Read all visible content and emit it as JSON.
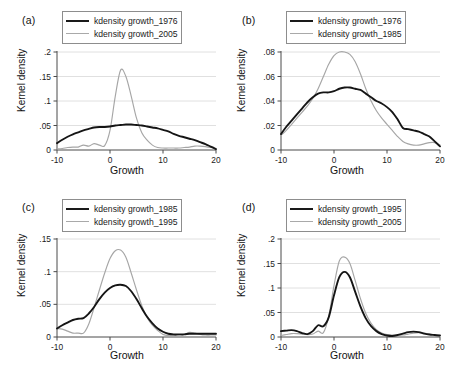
{
  "figure": {
    "xlabel": "Growth",
    "ylabel": "Kernel density",
    "xticks": [
      "-10",
      "0",
      "10",
      "20"
    ]
  },
  "panels": [
    {
      "label": "(a)",
      "legend": [
        {
          "name": "kdensity growth_1976",
          "style": "dark"
        },
        {
          "name": "kdensity growth_2005",
          "style": "light"
        }
      ],
      "yticks": [
        "0",
        ".05",
        ".1",
        ".15",
        ".2"
      ]
    },
    {
      "label": "(b)",
      "legend": [
        {
          "name": "kdensity growth_1976",
          "style": "dark"
        },
        {
          "name": "kdensity growth_1985",
          "style": "light"
        }
      ],
      "yticks": [
        "0",
        ".02",
        ".04",
        ".06",
        ".08"
      ]
    },
    {
      "label": "(c)",
      "legend": [
        {
          "name": "kdensity growth_1985",
          "style": "dark"
        },
        {
          "name": "kdensity growth_1995",
          "style": "light"
        }
      ],
      "yticks": [
        "0",
        ".05",
        ".1",
        ".15"
      ]
    },
    {
      "label": "(d)",
      "legend": [
        {
          "name": "kdensity growth_1995",
          "style": "dark"
        },
        {
          "name": "kdensity growth_2005",
          "style": "light"
        }
      ],
      "yticks": [
        "0",
        ".05",
        ".1",
        ".15",
        ".2"
      ]
    }
  ],
  "chart_data": [
    {
      "type": "line",
      "panel": "(a)",
      "title": "",
      "xlabel": "Growth",
      "ylabel": "Kernel density",
      "xlim": [
        -10,
        20
      ],
      "ylim": [
        0,
        0.2
      ],
      "grid": true,
      "legend_position": "top-center",
      "x": [
        -10,
        -9,
        -8,
        -7,
        -6,
        -5,
        -4,
        -3,
        -2,
        -1,
        0,
        1,
        2,
        3,
        4,
        5,
        6,
        7,
        8,
        9,
        10,
        11,
        12,
        13,
        14,
        15,
        16,
        17,
        18,
        19,
        20
      ],
      "series": [
        {
          "name": "kdensity growth_1976",
          "color": "#151515",
          "values": [
            0.014,
            0.021,
            0.027,
            0.032,
            0.036,
            0.04,
            0.043,
            0.046,
            0.047,
            0.047,
            0.048,
            0.05,
            0.051,
            0.052,
            0.052,
            0.051,
            0.05,
            0.048,
            0.046,
            0.044,
            0.041,
            0.038,
            0.033,
            0.029,
            0.026,
            0.023,
            0.02,
            0.016,
            0.012,
            0.007,
            0.002
          ]
        },
        {
          "name": "kdensity growth_2005",
          "color": "#a6a6a6",
          "values": [
            0.002,
            0.003,
            0.005,
            0.006,
            0.006,
            0.01,
            0.008,
            0.013,
            0.01,
            0.009,
            0.04,
            0.11,
            0.163,
            0.15,
            0.11,
            0.065,
            0.035,
            0.02,
            0.01,
            0.005,
            0.004,
            0.004,
            0.004,
            0.004,
            0.005,
            0.006,
            0.008,
            0.008,
            0.007,
            0.005,
            0.002
          ]
        }
      ]
    },
    {
      "type": "line",
      "panel": "(b)",
      "title": "",
      "xlabel": "Growth",
      "ylabel": "Kernel density",
      "xlim": [
        -10,
        20
      ],
      "ylim": [
        0,
        0.08
      ],
      "grid": true,
      "legend_position": "top-center",
      "x": [
        -10,
        -9,
        -8,
        -7,
        -6,
        -5,
        -4,
        -3,
        -2,
        -1,
        0,
        1,
        2,
        3,
        4,
        5,
        6,
        7,
        8,
        9,
        10,
        11,
        12,
        13,
        14,
        15,
        16,
        17,
        18,
        19,
        20
      ],
      "series": [
        {
          "name": "kdensity growth_1976",
          "color": "#151515",
          "values": [
            0.013,
            0.019,
            0.024,
            0.029,
            0.034,
            0.039,
            0.043,
            0.046,
            0.047,
            0.047,
            0.048,
            0.05,
            0.051,
            0.051,
            0.05,
            0.049,
            0.046,
            0.043,
            0.04,
            0.038,
            0.035,
            0.031,
            0.025,
            0.018,
            0.017,
            0.016,
            0.015,
            0.013,
            0.011,
            0.007,
            0.003
          ]
        },
        {
          "name": "kdensity growth_1985",
          "color": "#a6a6a6",
          "values": [
            0.012,
            0.016,
            0.021,
            0.026,
            0.031,
            0.036,
            0.042,
            0.05,
            0.06,
            0.07,
            0.077,
            0.08,
            0.08,
            0.078,
            0.072,
            0.062,
            0.05,
            0.04,
            0.032,
            0.026,
            0.021,
            0.016,
            0.011,
            0.007,
            0.005,
            0.004,
            0.004,
            0.005,
            0.006,
            0.006,
            0.004
          ]
        }
      ]
    },
    {
      "type": "line",
      "panel": "(c)",
      "title": "",
      "xlabel": "Growth",
      "ylabel": "Kernel density",
      "xlim": [
        -10,
        20
      ],
      "ylim": [
        0,
        0.15
      ],
      "grid": true,
      "legend_position": "top-center",
      "x": [
        -10,
        -9,
        -8,
        -7,
        -6,
        -5,
        -4,
        -3,
        -2,
        -1,
        0,
        1,
        2,
        3,
        4,
        5,
        6,
        7,
        8,
        9,
        10,
        11,
        12,
        13,
        14,
        15,
        16,
        17,
        18,
        19,
        20
      ],
      "series": [
        {
          "name": "kdensity growth_1985",
          "color": "#151515",
          "values": [
            0.013,
            0.018,
            0.022,
            0.026,
            0.028,
            0.029,
            0.036,
            0.046,
            0.058,
            0.068,
            0.075,
            0.079,
            0.08,
            0.078,
            0.07,
            0.058,
            0.044,
            0.031,
            0.021,
            0.013,
            0.008,
            0.005,
            0.004,
            0.004,
            0.004,
            0.005,
            0.005,
            0.005,
            0.005,
            0.005,
            0.005
          ]
        },
        {
          "name": "kdensity growth_1995",
          "color": "#a6a6a6",
          "values": [
            0.013,
            0.012,
            0.009,
            0.006,
            0.006,
            0.006,
            0.02,
            0.045,
            0.072,
            0.098,
            0.12,
            0.132,
            0.133,
            0.122,
            0.098,
            0.072,
            0.048,
            0.03,
            0.018,
            0.01,
            0.004,
            0.002,
            0.002,
            0.003,
            0.004,
            0.007,
            0.006,
            0.004,
            0.003,
            0.003,
            0.003
          ]
        }
      ]
    },
    {
      "type": "line",
      "panel": "(d)",
      "title": "",
      "xlabel": "Growth",
      "ylabel": "Kernel density",
      "xlim": [
        -10,
        20
      ],
      "ylim": [
        0,
        0.2
      ],
      "grid": true,
      "legend_position": "top-center",
      "x": [
        -10,
        -9,
        -8,
        -7,
        -6,
        -5,
        -4,
        -3,
        -2,
        -1,
        0,
        1,
        2,
        3,
        4,
        5,
        6,
        7,
        8,
        9,
        10,
        11,
        12,
        13,
        14,
        15,
        16,
        17,
        18,
        19,
        20
      ],
      "series": [
        {
          "name": "kdensity growth_1995",
          "color": "#151515",
          "values": [
            0.012,
            0.013,
            0.014,
            0.012,
            0.008,
            0.006,
            0.012,
            0.024,
            0.022,
            0.04,
            0.085,
            0.122,
            0.133,
            0.122,
            0.092,
            0.062,
            0.038,
            0.022,
            0.012,
            0.006,
            0.003,
            0.002,
            0.004,
            0.007,
            0.01,
            0.011,
            0.01,
            0.007,
            0.005,
            0.004,
            0.003
          ]
        },
        {
          "name": "kdensity growth_2005",
          "color": "#a6a6a6",
          "values": [
            0.003,
            0.005,
            0.007,
            0.007,
            0.006,
            0.005,
            0.006,
            0.012,
            0.009,
            0.042,
            0.105,
            0.155,
            0.163,
            0.15,
            0.115,
            0.078,
            0.048,
            0.028,
            0.015,
            0.008,
            0.005,
            0.004,
            0.004,
            0.004,
            0.006,
            0.008,
            0.009,
            0.008,
            0.006,
            0.004,
            0.002
          ]
        }
      ]
    }
  ]
}
